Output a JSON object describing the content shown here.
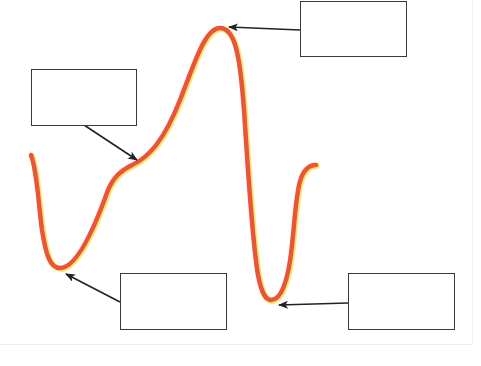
{
  "diagram": {
    "curve": {
      "stroke_color": "#e8553d",
      "glow_color": "#ffe66b",
      "points": {
        "start": [
          31,
          155
        ],
        "trough_1": [
          57,
          268
        ],
        "shoulder": [
          132,
          164
        ],
        "peak": [
          220,
          28
        ],
        "trough_2": [
          271,
          300
        ],
        "end": [
          316,
          165
        ]
      }
    },
    "arrow_color": "#222222",
    "label_boxes": [
      {
        "id": "box-shoulder",
        "x": 31,
        "y": 69,
        "w": 106,
        "h": 57,
        "text": "",
        "points_to": "shoulder"
      },
      {
        "id": "box-peak",
        "x": 300,
        "y": 1,
        "w": 107,
        "h": 56,
        "text": "",
        "points_to": "peak"
      },
      {
        "id": "box-trough-1",
        "x": 120,
        "y": 273,
        "w": 107,
        "h": 57,
        "text": "",
        "points_to": "trough_1"
      },
      {
        "id": "box-trough-2",
        "x": 348,
        "y": 273,
        "w": 107,
        "h": 57,
        "text": "",
        "points_to": "trough_2"
      }
    ]
  }
}
